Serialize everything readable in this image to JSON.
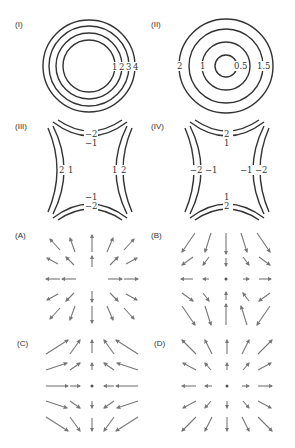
{
  "figure": {
    "contour_panels": [
      {
        "id": "I",
        "label": "(I)",
        "type": "concentric-circles",
        "levels": [
          "1",
          "2",
          "3",
          "4"
        ],
        "label_side": "right",
        "center": [
          89,
          66
        ],
        "radii": [
          26,
          33,
          40,
          46
        ]
      },
      {
        "id": "II",
        "label": "(II)",
        "type": "concentric-circles",
        "levels_left": [
          "2",
          "1"
        ],
        "levels_right": [
          "0.5",
          "1.5"
        ],
        "center": [
          226,
          66
        ],
        "radii": [
          11,
          24,
          37,
          47
        ]
      },
      {
        "id": "III",
        "label": "(III)",
        "type": "saddle-hyperbolas",
        "top_labels": [
          "−2",
          "−1"
        ],
        "bottom_labels": [
          "−1",
          "−2"
        ],
        "left_labels": [
          "2",
          "1"
        ],
        "right_labels": [
          "1",
          "2"
        ]
      },
      {
        "id": "IV",
        "label": "(IV)",
        "type": "saddle-hyperbolas",
        "top_labels": [
          "2",
          "1"
        ],
        "bottom_labels": [
          "1",
          "2"
        ],
        "left_labels": [
          "−2",
          "−1"
        ],
        "right_labels": [
          "−1",
          "−2"
        ]
      }
    ],
    "vector_panels": [
      {
        "id": "A",
        "label": "(A)",
        "description": "x-component outward, y-component inward: F = (x, -y)-like saddle"
      },
      {
        "id": "B",
        "label": "(B)",
        "description": "F = (x, -y) variant; arrows toward center vertically, outward horizontally"
      },
      {
        "id": "C",
        "label": "(C)",
        "description": "F = (-x, y); arrows inward horizontally, outward vertically"
      },
      {
        "id": "D",
        "label": "(D)",
        "description": "F = (x, y); radial outward"
      }
    ],
    "colors": {
      "contour": "#333333",
      "arrow": "#777777",
      "text": "#333333"
    }
  }
}
